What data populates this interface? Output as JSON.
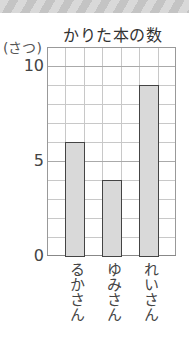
{
  "chart_data": {
    "type": "bar",
    "title": "かりた本の数",
    "ylabel": "(さつ)",
    "xlabel": "",
    "categories": [
      "るかさん",
      "ゆみさん",
      "れいさん"
    ],
    "values": [
      6,
      4,
      9
    ],
    "ylim": [
      0,
      11
    ],
    "yticks": [
      0,
      5,
      10
    ],
    "ytick_labels": [
      "0",
      "5",
      "10"
    ],
    "grid": true,
    "legend": null,
    "bar_color": "#d9d9d9",
    "bar_edge_color": "#444444"
  }
}
